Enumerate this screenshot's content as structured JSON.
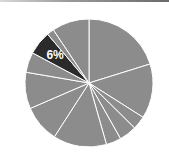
{
  "chart_data": {
    "type": "pie",
    "title": "",
    "start_angle_deg": 0,
    "direction": "clockwise",
    "slices": [
      {
        "label": "",
        "value": 20.2,
        "color": "#8c8c8c",
        "highlight": false
      },
      {
        "label": "",
        "value": 13.8,
        "color": "#8c8c8c",
        "highlight": false
      },
      {
        "label": "",
        "value": 3.4,
        "color": "#8c8c8c",
        "highlight": false
      },
      {
        "label": "",
        "value": 4.4,
        "color": "#8c8c8c",
        "highlight": false
      },
      {
        "label": "",
        "value": 3.8,
        "color": "#8c8c8c",
        "highlight": false
      },
      {
        "label": "",
        "value": 13.5,
        "color": "#8c8c8c",
        "highlight": false
      },
      {
        "label": "",
        "value": 9.4,
        "color": "#8c8c8c",
        "highlight": false
      },
      {
        "label": "",
        "value": 9.2,
        "color": "#8c8c8c",
        "highlight": false
      },
      {
        "label": "",
        "value": 5.1,
        "color": "#8c8c8c",
        "highlight": false
      },
      {
        "label": "6%",
        "value": 6.0,
        "color": "#2b2b2b",
        "highlight": true
      },
      {
        "label": "",
        "value": 1.8,
        "color": "#8c8c8c",
        "highlight": false
      },
      {
        "label": "",
        "value": 9.4,
        "color": "#8c8c8c",
        "highlight": false
      }
    ],
    "annotations": [
      "6%"
    ],
    "legend": null
  },
  "chart": {
    "highlight_label": "6%",
    "center": [
      89,
      83
    ],
    "radius": 64,
    "separator_color": "#ffffff",
    "base_color": "#8c8c8c",
    "highlight_color": "#2b2b2b"
  }
}
